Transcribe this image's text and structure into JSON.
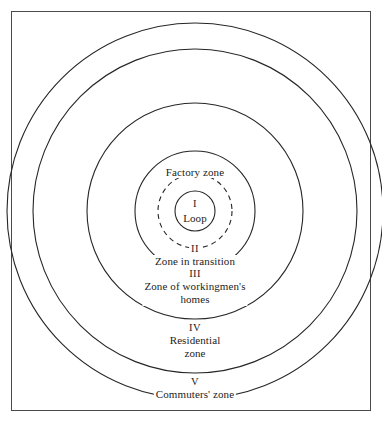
{
  "figure": {
    "background_color": "#ffffff",
    "line_color": "#262626",
    "frame_color": "#4a4a4a",
    "center_x": 195,
    "center_y": 211
  },
  "rings": [
    {
      "id": "loop",
      "numeral": "I",
      "name": "Loop",
      "radius": 20,
      "style": "solid",
      "label_position": "center"
    },
    {
      "id": "factory",
      "numeral": "",
      "name": "Factory zone",
      "radius": 37,
      "style": "dashed",
      "label_position": "top-arc"
    },
    {
      "id": "transition",
      "numeral": "II",
      "name": "Zone in transition",
      "radius": 60,
      "style": "solid",
      "label_position": "bottom-arc"
    },
    {
      "id": "workingmens-homes",
      "numeral": "III",
      "name": "Zone of workingmen's\nhomes",
      "name_line1": "Zone of workingmen's",
      "name_line2": "homes",
      "radius": 108,
      "style": "solid",
      "label_position": "bottom-arc"
    },
    {
      "id": "residential",
      "numeral": "IV",
      "name_line1": "Residential",
      "name_line2": "zone",
      "radius": 162,
      "style": "solid",
      "label_position": "bottom-arc"
    },
    {
      "id": "commuters",
      "numeral": "V",
      "name_line1": "Commuters' zone",
      "name_line2": "",
      "radius": 188,
      "style": "solid",
      "label_position": "bottom-arc"
    }
  ],
  "labels": {
    "loop_numeral": "I",
    "loop_name": "Loop",
    "factory_name": "Factory zone",
    "transition_numeral": "II",
    "transition_name": "Zone in transition",
    "workingmens_numeral": "III",
    "workingmens_line1": "Zone of workingmen's",
    "workingmens_line2": "homes",
    "residential_numeral": "IV",
    "residential_line1": "Residential",
    "residential_line2": "zone",
    "commuters_numeral": "V",
    "commuters_name": "Commuters' zone"
  }
}
